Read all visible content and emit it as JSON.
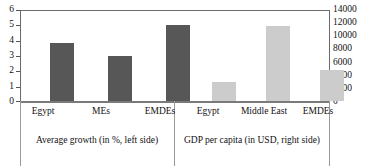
{
  "chart_data": {
    "type": "bar",
    "title": "",
    "subtitle": "",
    "xlabel": "",
    "grid": false,
    "legend_position": "none",
    "panels": [
      {
        "name": "average-growth",
        "caption": "Average growth (in %, left side)",
        "axis": "left",
        "categories": [
          "Egypt",
          "MEs",
          "EMDEs"
        ],
        "values": [
          3.85,
          3.0,
          5.0
        ],
        "color": "#575757"
      },
      {
        "name": "gdp-per-capita",
        "caption": "GDP per capita (in USD, right side)",
        "axis": "right",
        "categories": [
          "Egypt",
          "Middle East",
          "EMDEs"
        ],
        "values": [
          3000,
          11500,
          4800
        ],
        "color": "#cccccc"
      }
    ],
    "axes": {
      "left": {
        "label": "Average growth (in %, left side)",
        "ylim": [
          0,
          6
        ],
        "ticks": [
          0,
          1,
          2,
          3,
          4,
          5,
          6
        ],
        "tick_labels": [
          "0",
          "1",
          "2",
          "3",
          "4",
          "5",
          "6"
        ]
      },
      "right": {
        "label": "GDP per capita (in USD, right side)",
        "ylim": [
          0,
          14000
        ],
        "ticks": [
          0,
          2000,
          4000,
          6000,
          8000,
          10000,
          12000,
          14000
        ],
        "tick_labels": [
          "0",
          "2000",
          "4000",
          "6000",
          "8000",
          "10000",
          "12000",
          "14000"
        ]
      }
    },
    "colors": {
      "growth_bar": "#575757",
      "gdp_bar": "#cccccc",
      "axis_line": "#6b6b6b",
      "divider": "#9a9a9a",
      "background": "#ffffff",
      "text": "#111111"
    }
  }
}
